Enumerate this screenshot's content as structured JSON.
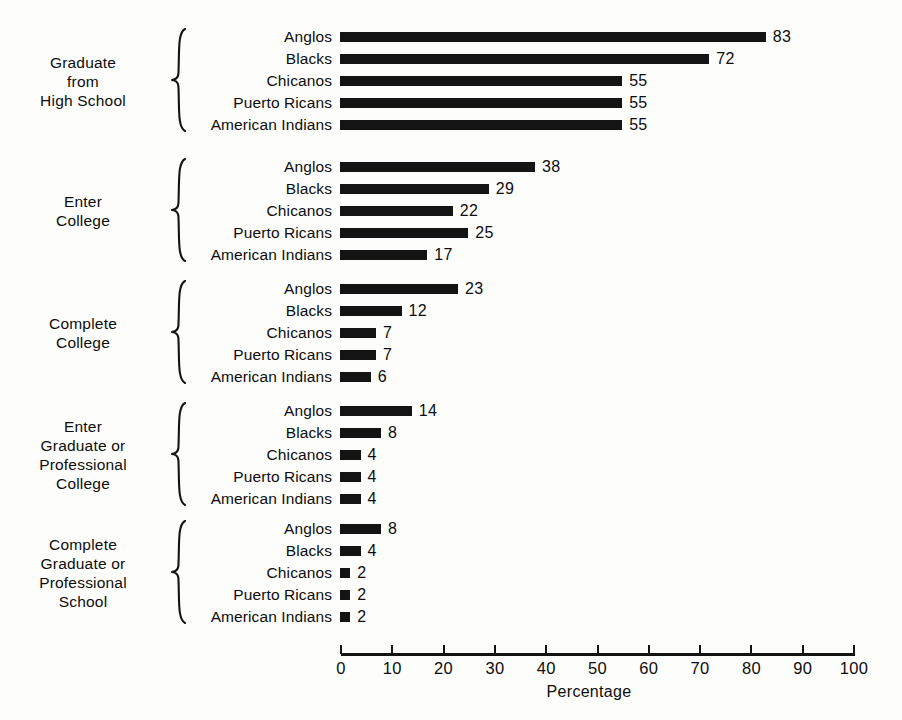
{
  "chart_data": {
    "type": "bar",
    "orientation": "horizontal",
    "title": "",
    "xlabel": "Percentage",
    "ylabel": "",
    "xlim": [
      0,
      100
    ],
    "xticks": [
      0,
      10,
      20,
      30,
      40,
      50,
      60,
      70,
      80,
      90,
      100
    ],
    "grid": false,
    "legend": "none",
    "bar_color": "#141414",
    "categories": [
      "Anglos",
      "Blacks",
      "Chicanos",
      "Puerto Ricans",
      "American Indians"
    ],
    "groups": [
      {
        "label": "Graduate\nfrom\nHigh School",
        "label_lines": [
          "Graduate",
          "from",
          "High School"
        ],
        "values": [
          83,
          72,
          55,
          55,
          55
        ]
      },
      {
        "label": "Enter\nCollege",
        "label_lines": [
          "Enter",
          "College"
        ],
        "values": [
          38,
          29,
          22,
          25,
          17
        ]
      },
      {
        "label": "Complete\nCollege",
        "label_lines": [
          "Complete",
          "College"
        ],
        "values": [
          23,
          12,
          7,
          7,
          6
        ]
      },
      {
        "label": "Enter\nGraduate or\nProfessional\nCollege",
        "label_lines": [
          "Enter",
          "Graduate or",
          "Professional",
          "College"
        ],
        "values": [
          14,
          8,
          4,
          4,
          4
        ]
      },
      {
        "label": "Complete\nGraduate or\nProfessional\nSchool",
        "label_lines": [
          "Complete",
          "Graduate or",
          "Professional",
          "School"
        ],
        "values": [
          8,
          4,
          2,
          2,
          2
        ]
      }
    ],
    "series": [
      {
        "name": "Anglos",
        "values": [
          83,
          38,
          23,
          14,
          8
        ]
      },
      {
        "name": "Blacks",
        "values": [
          72,
          29,
          12,
          8,
          4
        ]
      },
      {
        "name": "Chicanos",
        "values": [
          55,
          22,
          7,
          4,
          2
        ]
      },
      {
        "name": "Puerto Ricans",
        "values": [
          55,
          25,
          7,
          4,
          2
        ]
      },
      {
        "name": "American Indians",
        "values": [
          55,
          17,
          6,
          4,
          2
        ]
      }
    ]
  },
  "layout": {
    "bar_origin_x": 340,
    "px_per_unit": 5.13,
    "row_pitch": 22,
    "group_tops": [
      26,
      156,
      278,
      400,
      518
    ],
    "axis_tick_x0": 341,
    "axis_tick_x100": 854
  }
}
